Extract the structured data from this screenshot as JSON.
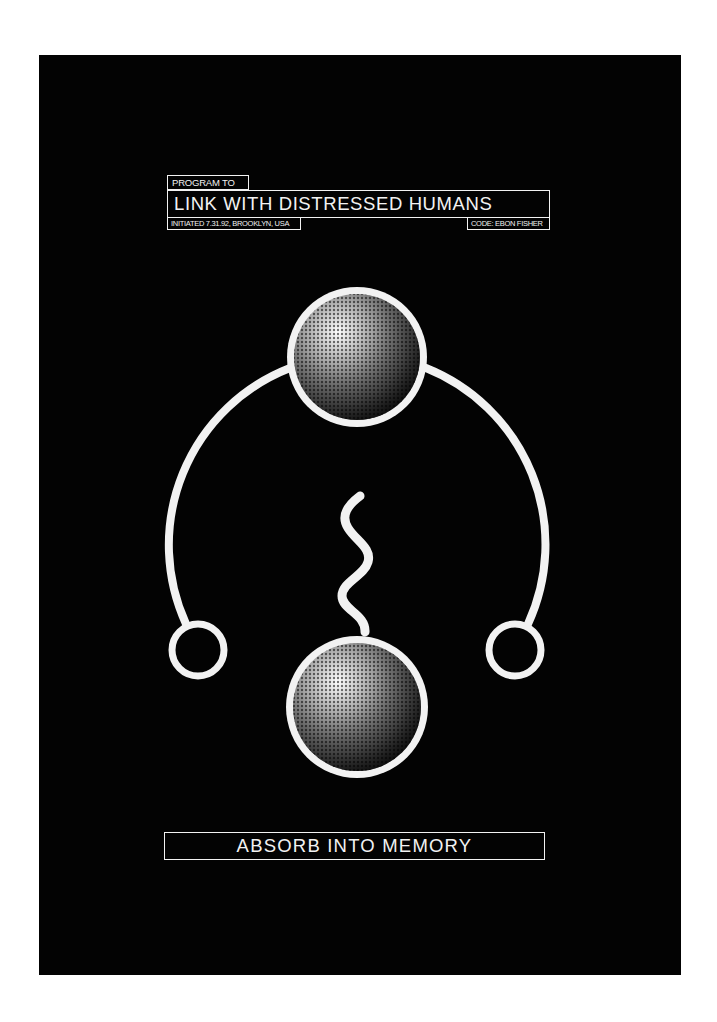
{
  "poster": {
    "background_color": "#030303",
    "foreground_color": "#f2f2f2",
    "header": {
      "pre_title": "PROGRAM TO",
      "title": "LINK WITH DISTRESSED HUMANS",
      "initiated": "INITIATED 7.31.92, BROOKLYN, USA",
      "code": "CODE: EBON FISHER"
    },
    "graphic": {
      "top_sphere": "halftone-sphere-icon",
      "bottom_sphere": "halftone-sphere-icon",
      "connector": "arc-icon",
      "left_node": "ring-icon",
      "right_node": "ring-icon",
      "link": "squiggle-icon"
    },
    "footer": {
      "call_to_action": "ABSORB INTO MEMORY"
    }
  }
}
